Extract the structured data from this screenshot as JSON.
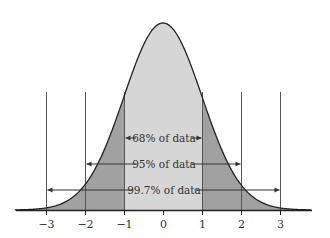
{
  "chart_data": {
    "type": "area",
    "title": "",
    "xlabel": "",
    "ylabel": "",
    "x_ticks": [
      "−3",
      "−2",
      "−1",
      "0",
      "1",
      "2",
      "3"
    ],
    "xlim": [
      -3.8,
      3.8
    ],
    "grid": false,
    "legend": null,
    "regions": [
      {
        "range": [
          -1,
          1
        ],
        "label": "68% of data",
        "percent": 68,
        "color": "#d6d6d6"
      },
      {
        "range": [
          -2,
          2
        ],
        "label": "95% of data",
        "percent": 95,
        "color": "#a3a3a3"
      },
      {
        "range": [
          -3,
          3
        ],
        "label": "99.7% of data",
        "percent": 99.7,
        "color": "#8c8c8c"
      }
    ],
    "annotations": [
      "68% of data",
      "95% of data",
      "99.7% of data"
    ]
  },
  "colors": {
    "center_fill": "#d6d6d6",
    "tail_fill": "#a1a1a1",
    "curve": "#222222",
    "lines": "#555555"
  }
}
